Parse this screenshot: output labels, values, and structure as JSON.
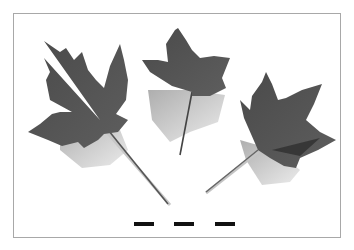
{
  "image": {
    "description": "Three grayscale maple-type leaves with petioles arranged in an arc inside a thin rectangular frame, with three short black scale dashes below",
    "subject": "leaves",
    "leaf_count": 3,
    "scale_marks": 3,
    "colors": {
      "background": "#ffffff",
      "frame": "#a8a8a8",
      "leaf_dark": "#3c3c3c",
      "leaf_mid": "#6a6a6a",
      "shadow": "#bdbdbd",
      "scale_mark": "#111111"
    }
  }
}
